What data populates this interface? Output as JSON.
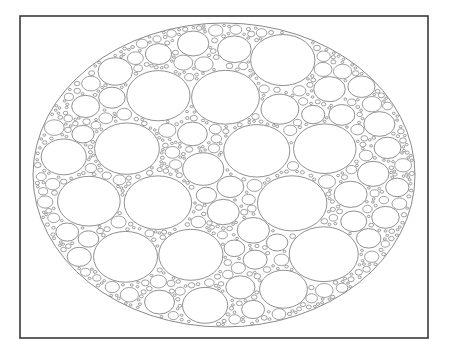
{
  "figure": {
    "type": "circle-packing",
    "canvas": {
      "width": 450,
      "height": 355
    },
    "background_color": "#ffffff"
  },
  "frame": {
    "name": "plot-border",
    "x": 20,
    "y": 16,
    "width": 408,
    "height": 322,
    "stroke_color": "#3a3a3a",
    "stroke_width": 1.6,
    "fill_color": "#ffffff"
  },
  "boundary_ellipse": {
    "name": "bounding-ellipse",
    "cx": 224,
    "cy": 175,
    "rx": 191,
    "ry": 152,
    "stroke_color": "#6b6b6b",
    "stroke_width": 0.8,
    "fill_color": "#ffffff"
  },
  "packing": {
    "stroke_color": "#6b6b6b",
    "stroke_width": 0.75,
    "fill_color": "#ffffff",
    "aspect_ratio": 1.26,
    "max_radius": 27.5,
    "min_radius": 1.15,
    "attempts": 26000,
    "gap": 0.55,
    "rim_margin": 0.6,
    "random_seed": 20240517,
    "size_bias": 2.45,
    "large_count_target": 33
  },
  "chart_data": {
    "type": "scatter",
    "xlabel": "",
    "ylabel": "",
    "grid": false,
    "legend": null,
    "xlim": [
      20,
      428
    ],
    "ylim": [
      16,
      338
    ],
    "notes": [
      "All packed ellipses share the same horizontal/vertical aspect ratio of about 1.26",
      "Roughly 33 large ellipses occupy the interior",
      "Several hundred progressively smaller ellipses fill remaining space",
      "Outer rectangular frame is drawn in dark gray, about 1.6 px wide"
    ]
  }
}
